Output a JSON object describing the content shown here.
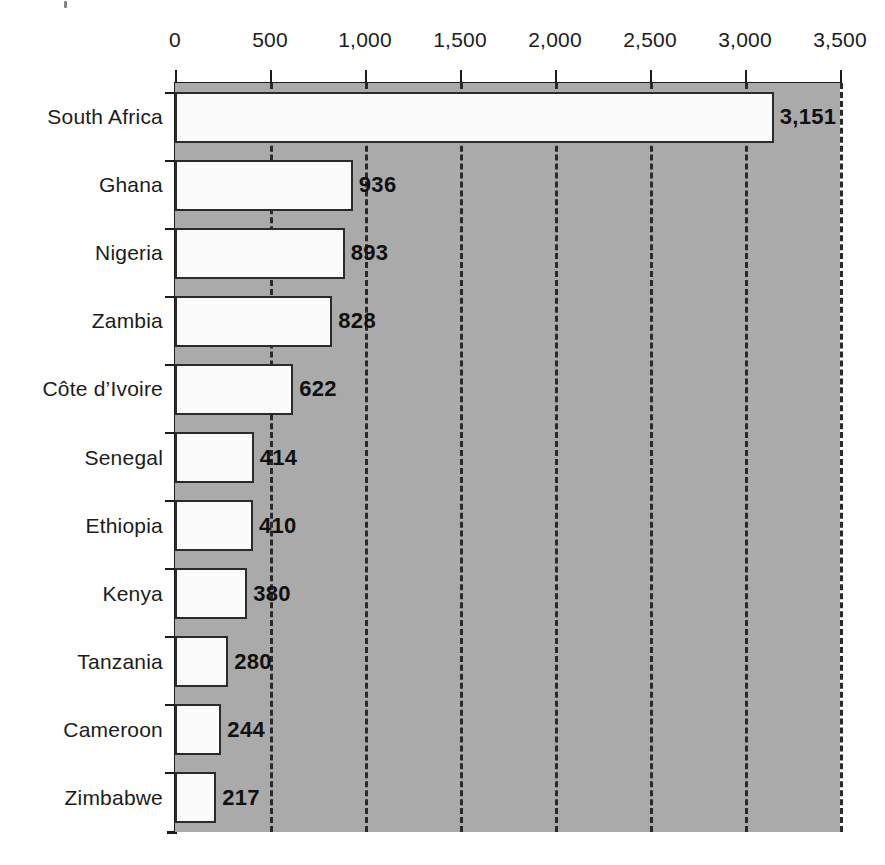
{
  "chart_data": {
    "type": "bar",
    "orientation": "horizontal",
    "title": "",
    "subtitle": "",
    "xlabel": "",
    "ylabel": "",
    "xlim": [
      0,
      3500
    ],
    "ylim": null,
    "grid": true,
    "grid_axis": "x",
    "grid_style": "dashed",
    "legend": false,
    "legend_position": "none",
    "x_axis_position": "top",
    "categories": [
      "South Africa",
      "Ghana",
      "Nigeria",
      "Zambia",
      "Côte d’Ivoire",
      "Senegal",
      "Ethiopia",
      "Kenya",
      "Tanzania",
      "Cameroon",
      "Zimbabwe"
    ],
    "values": [
      3151,
      936,
      893,
      828,
      622,
      414,
      410,
      380,
      280,
      244,
      217
    ],
    "value_labels": [
      "3,151",
      "936",
      "893",
      "828",
      "622",
      "414",
      "410",
      "380",
      "280",
      "244",
      "217"
    ],
    "xticks": [
      0,
      500,
      1000,
      1500,
      2000,
      2500,
      3000,
      3500
    ],
    "xtick_labels": [
      "0",
      "500",
      "1,000",
      "1,500",
      "2,000",
      "2,500",
      "3,000",
      "3,500"
    ],
    "colors": {
      "plot_background": "#aaaaaa",
      "page_background": "#ffffff",
      "bar_fill": "#fbfbfb",
      "bar_border": "#2b2b2b",
      "axis": "#1c1c1c",
      "gridline": "#2a2a2a",
      "text": "#1c1c1c",
      "value_label_text": "#101010"
    }
  }
}
